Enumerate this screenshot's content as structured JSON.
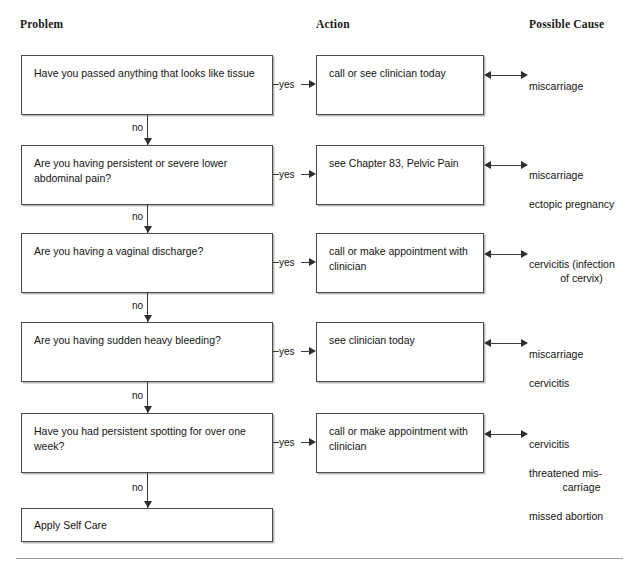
{
  "headers": {
    "problem": "Problem",
    "action": "Action",
    "cause": "Possible Cause"
  },
  "labels": {
    "yes": "yes",
    "no": "no"
  },
  "colors": {
    "box_border": "#4a4a4a",
    "box_shadow": "#b9b9b9",
    "arrow": "#2e2e2e",
    "text": "#141414",
    "rule": "#9a9a9a",
    "background": "#ffffff"
  },
  "rows": [
    {
      "problem": "Have you passed anything that looks like tissue",
      "action": "call or see clinician today",
      "cause_line1": "miscarriage",
      "cause_line2": "",
      "cause_line3": "",
      "cause_line4": ""
    },
    {
      "problem": "Are you having persistent or severe lower abdominal pain?",
      "action": "see Chapter 83, Pelvic Pain",
      "cause_line1": "miscarriage",
      "cause_line2": "ectopic pregnancy",
      "cause_line3": "",
      "cause_line4": ""
    },
    {
      "problem": "Are you having a vaginal discharge?",
      "action": "call or make appointment with clinician",
      "cause_line1": "cervicitis (infection",
      "cause_line2": "of cervix)",
      "cause_line3": "",
      "cause_line4": ""
    },
    {
      "problem": "Are you having sudden heavy bleeding?",
      "action": "see clinician today",
      "cause_line1": "miscarriage",
      "cause_line2": "cervicitis",
      "cause_line3": "",
      "cause_line4": ""
    },
    {
      "problem": "Have you had persistent spotting for over one week?",
      "action": "call or make appointment with clinician",
      "cause_line1": "cervicitis",
      "cause_line2": "threatened mis-",
      "cause_line3": "carriage",
      "cause_line4": "missed abortion"
    }
  ],
  "terminal": {
    "label": "Apply Self Care"
  }
}
